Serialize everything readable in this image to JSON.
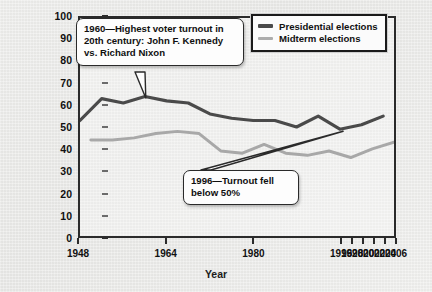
{
  "chart_data": {
    "type": "line",
    "title": "",
    "xlabel": "Year",
    "ylabel": "Percentage",
    "ylim": [
      0,
      100
    ],
    "ytick_values": [
      0,
      10,
      20,
      30,
      40,
      50,
      60,
      70,
      80,
      90,
      100
    ],
    "xtick_labels": [
      "1948",
      "1964",
      "1980",
      "1996",
      "1998",
      "2000",
      "2002",
      "2004",
      "2006"
    ],
    "xtick_positions": [
      0,
      16,
      32,
      48,
      50,
      52,
      54,
      56,
      58
    ],
    "x_axis_note": "non-linear: 16-year spacing through 1996, then 2-year spacing",
    "grid": false,
    "legend_position": "top-right",
    "series": [
      {
        "name": "Presidential elections",
        "color": "#4a4a4a",
        "x": [
          1948,
          1952,
          1956,
          1960,
          1964,
          1968,
          1972,
          1976,
          1980,
          1984,
          1988,
          1992,
          1996,
          2000,
          2004
        ],
        "values": [
          53,
          63,
          61,
          64,
          62,
          61,
          56,
          54,
          53,
          53,
          50,
          55,
          49,
          51,
          55
        ]
      },
      {
        "name": "Midterm elections",
        "color": "#a8a8a8",
        "x": [
          1950,
          1954,
          1958,
          1962,
          1966,
          1970,
          1974,
          1978,
          1982,
          1986,
          1990,
          1994,
          1998,
          2002,
          2006
        ],
        "values": [
          44,
          44,
          45,
          47,
          48,
          47,
          39,
          38,
          42,
          38,
          37,
          39,
          36,
          40,
          43
        ]
      }
    ],
    "annotations": [
      {
        "id": "callout-1960",
        "text": "1960—Highest voter turnout in\n20th century: John F. Kennedy\nvs. Richard Nixon",
        "points_to_year": 1960,
        "points_to_value": 64
      },
      {
        "id": "callout-1996",
        "text": "1996—Turnout fell\nbelow 50%",
        "points_to_year": 1996,
        "points_to_value": 49
      }
    ]
  },
  "legend": {
    "items": [
      {
        "label": "Presidential elections",
        "color": "#4a4a4a"
      },
      {
        "label": "Midterm elections",
        "color": "#adadad"
      }
    ]
  },
  "axes": {
    "y_title": "Percentage",
    "x_title": "Year"
  }
}
